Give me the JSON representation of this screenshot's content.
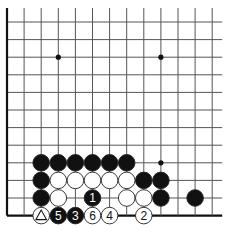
{
  "diagram": {
    "type": "go-board-problem",
    "grid": {
      "cols": 13,
      "rows": 12,
      "x0": 7,
      "dx": 17.1,
      "y0": 22,
      "dy": 17.6,
      "line_color": "#555555",
      "edges": {
        "left": true,
        "bottom": true,
        "top": false,
        "right": false
      }
    },
    "star_points": [
      {
        "col": 3,
        "row": 2
      },
      {
        "col": 9,
        "row": 2
      },
      {
        "col": 9,
        "row": 8
      }
    ],
    "stones": [
      {
        "color": "black",
        "col": 2,
        "row": 8,
        "label": ""
      },
      {
        "color": "black",
        "col": 3,
        "row": 8,
        "label": ""
      },
      {
        "color": "black",
        "col": 4,
        "row": 8,
        "label": ""
      },
      {
        "color": "black",
        "col": 5,
        "row": 8,
        "label": ""
      },
      {
        "color": "black",
        "col": 6,
        "row": 8,
        "label": ""
      },
      {
        "color": "black",
        "col": 7,
        "row": 8,
        "label": ""
      },
      {
        "color": "black",
        "col": 2,
        "row": 9,
        "label": ""
      },
      {
        "color": "white",
        "col": 3,
        "row": 9,
        "label": ""
      },
      {
        "color": "white",
        "col": 4,
        "row": 9,
        "label": ""
      },
      {
        "color": "white",
        "col": 5,
        "row": 9,
        "label": ""
      },
      {
        "color": "white",
        "col": 6,
        "row": 9,
        "label": ""
      },
      {
        "color": "white",
        "col": 7,
        "row": 9,
        "label": ""
      },
      {
        "color": "black",
        "col": 8,
        "row": 9,
        "label": ""
      },
      {
        "color": "black",
        "col": 9,
        "row": 9,
        "label": ""
      },
      {
        "color": "black",
        "col": 2,
        "row": 10,
        "label": ""
      },
      {
        "color": "white",
        "col": 3,
        "row": 10,
        "label": ""
      },
      {
        "color": "black",
        "col": 5,
        "row": 10,
        "label": "1"
      },
      {
        "color": "white",
        "col": 7,
        "row": 10,
        "label": ""
      },
      {
        "color": "white",
        "col": 8,
        "row": 10,
        "label": ""
      },
      {
        "color": "black",
        "col": 9,
        "row": 10,
        "label": ""
      },
      {
        "color": "black",
        "col": 11,
        "row": 10,
        "label": ""
      },
      {
        "color": "white",
        "col": 2,
        "row": 11,
        "label": "",
        "marker": "triangle"
      },
      {
        "color": "black",
        "col": 3,
        "row": 11,
        "label": "5"
      },
      {
        "color": "black",
        "col": 4,
        "row": 11,
        "label": "3"
      },
      {
        "color": "white",
        "col": 5,
        "row": 11,
        "label": "6"
      },
      {
        "color": "white",
        "col": 6,
        "row": 11,
        "label": "4"
      },
      {
        "color": "white",
        "col": 8,
        "row": 11,
        "label": "2"
      }
    ],
    "colors": {
      "black_stone": "#111111",
      "white_stone": "#ffffff",
      "stone_outline": "#222222",
      "label_on_black": "#ffffff",
      "label_on_white": "#111111"
    }
  }
}
